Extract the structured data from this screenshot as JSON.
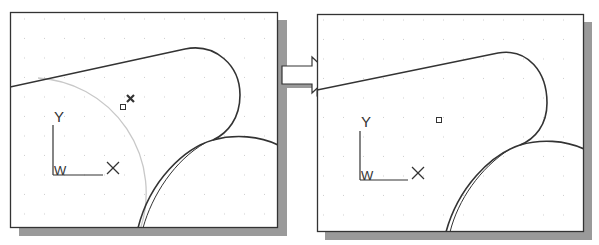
{
  "figure": {
    "arrow": {
      "direction": "right",
      "fill": "#ffffff",
      "stroke": "#333333"
    }
  },
  "panels": [
    {
      "id": "before",
      "ucs_icon": {
        "y_label": "Y",
        "x_label": "X",
        "w_label": "W"
      },
      "markers": {
        "pickbox": "square",
        "selection_marker": "x-mark"
      },
      "construction_circle": {
        "color": "#c8c8c8",
        "state": "highlighted"
      }
    },
    {
      "id": "after",
      "ucs_icon": {
        "y_label": "Y",
        "x_label": "X",
        "w_label": "W"
      },
      "markers": {
        "pickbox": "square"
      }
    }
  ],
  "colors": {
    "frame": "#333333",
    "shadow": "#9a9a9a",
    "grid_dot": "#b5b5b5",
    "geometry": "#333333",
    "background": "#ffffff"
  }
}
